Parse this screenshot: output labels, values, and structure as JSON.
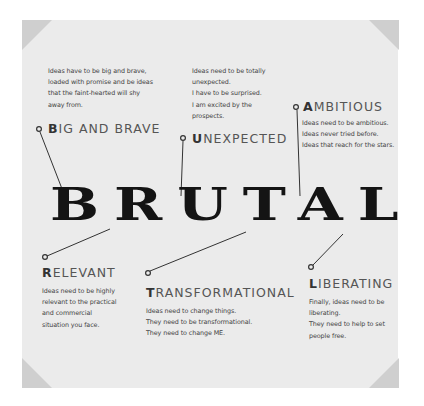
{
  "title": "BRUTAL",
  "colors": {
    "background": "#ffffff",
    "panel": "#ebebeb",
    "corner": "#cfcfcf",
    "title_text": "#141414",
    "heading_text": "#555555",
    "body_text": "#444444",
    "connector_line": "#333333"
  },
  "attributes": [
    {
      "id": "big-and-brave",
      "initial": "B",
      "rest": "IG AND BRAVE",
      "lines": [
        "Ideas have to be big and brave,",
        "loaded with promise and be ideas",
        "that the faint-hearted will shy",
        "away from."
      ]
    },
    {
      "id": "unexpected",
      "initial": "U",
      "rest": "NEXPECTED",
      "lines": [
        "Ideas need to be totally",
        "unexpected.",
        "I have to be surprised.",
        "I am excited by the",
        "prospects."
      ]
    },
    {
      "id": "ambitious",
      "initial": "A",
      "rest": "MBITIOUS",
      "lines": [
        "Ideas need to be ambitious.",
        "Ideas never tried before.",
        "Ideas that reach for the stars."
      ]
    },
    {
      "id": "relevant",
      "initial": "R",
      "rest": "ELEVANT",
      "lines": [
        "Ideas need to be highly",
        "relevant to the practical",
        "and commercial",
        "situation you face."
      ]
    },
    {
      "id": "transformational",
      "initial": "T",
      "rest": "RANSFORMATIONAL",
      "lines": [
        "Ideas need to change things.",
        "They need to be transformational.",
        "They need to change ME."
      ]
    },
    {
      "id": "liberating",
      "initial": "L",
      "rest": "IBERATING",
      "lines": [
        "Finally, ideas need to be",
        "liberating.",
        "They need to help to set",
        "people free."
      ]
    }
  ]
}
